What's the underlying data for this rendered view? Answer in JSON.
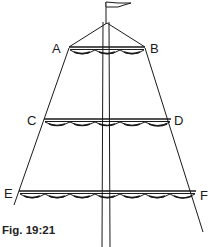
{
  "figure": {
    "caption": "Fig. 19:21",
    "points": {
      "A": "A",
      "B": "B",
      "C": "C",
      "D": "D",
      "E": "E",
      "F": "F"
    },
    "colors": {
      "ink": "#1a1a1a",
      "background": "#ffffff"
    }
  }
}
